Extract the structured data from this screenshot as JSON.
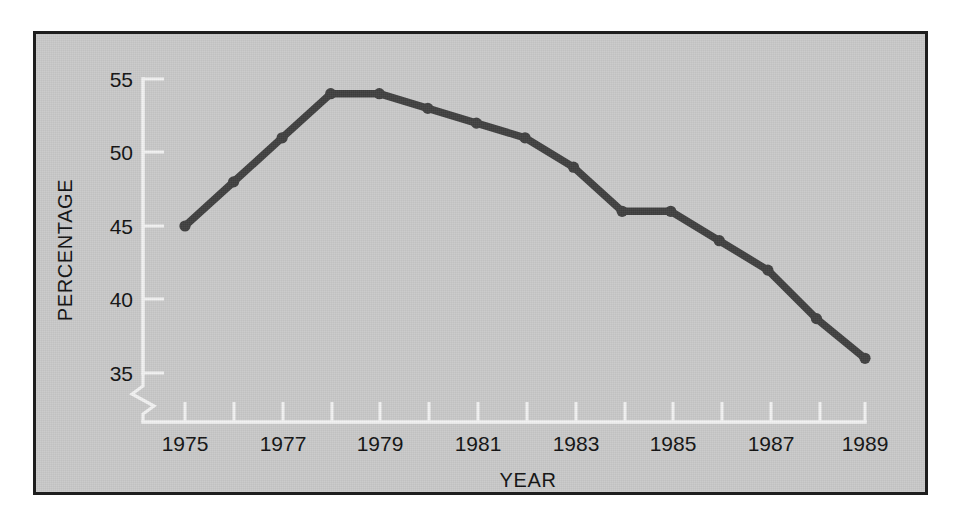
{
  "figure": {
    "background_color": "#c9c9c9",
    "frame_color": "#1e1e1e",
    "axis_color": "#f2f2f2",
    "line_color": "#404040"
  },
  "chart_data": {
    "type": "line",
    "title": "",
    "xlabel": "YEAR",
    "ylabel": "PERCENTAGE",
    "x": [
      1975,
      1976,
      1977,
      1978,
      1979,
      1980,
      1981,
      1982,
      1983,
      1984,
      1985,
      1986,
      1987,
      1988,
      1989
    ],
    "values": [
      45,
      48,
      51,
      54,
      54,
      53,
      52,
      51,
      49,
      46,
      46,
      44,
      42,
      38.7,
      36
    ],
    "xlim": [
      1974.6,
      1989.4
    ],
    "ylim": [
      33.5,
      56.5
    ],
    "xticks": [
      1975,
      1976,
      1977,
      1978,
      1979,
      1980,
      1981,
      1982,
      1983,
      1984,
      1985,
      1986,
      1987,
      1988,
      1989
    ],
    "xtick_labels": [
      "1975",
      "",
      "1977",
      "",
      "1979",
      "",
      "1981",
      "",
      "1983",
      "",
      "1985",
      "",
      "1987",
      "",
      "1989"
    ],
    "yticks": [
      35,
      40,
      45,
      50,
      55
    ],
    "ytick_labels": [
      "35",
      "40",
      "45",
      "50",
      "55"
    ],
    "grid": false,
    "legend": null,
    "axis_break": true,
    "markers": true
  }
}
